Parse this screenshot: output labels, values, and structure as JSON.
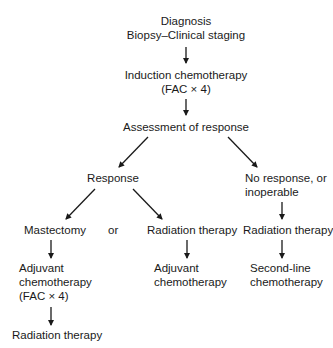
{
  "diagram": {
    "type": "flowchart",
    "nodes": {
      "diagnosis": {
        "line1": "Diagnosis",
        "line2": "Biopsy–Clinical staging"
      },
      "induction": {
        "line1": "Induction chemotherapy",
        "line2": "(FAC × 4)"
      },
      "assessment": {
        "label": "Assessment of response"
      },
      "response": {
        "label": "Response"
      },
      "no_response": {
        "line1": "No response, or",
        "line2": "inoperable"
      },
      "mastectomy": {
        "label": "Mastectomy"
      },
      "or_label": {
        "label": "or"
      },
      "radiation_mid": {
        "label": "Radiation therapy"
      },
      "radiation_right": {
        "label": "Radiation therapy"
      },
      "adjuvant_left": {
        "line1": "Adjuvant",
        "line2": "chemotherapy",
        "line3": "(FAC × 4)"
      },
      "adjuvant_mid": {
        "line1": "Adjuvant",
        "line2": "chemotherapy"
      },
      "second_line": {
        "line1": "Second-line",
        "line2": "chemotherapy"
      },
      "radiation_final": {
        "label": "Radiation therapy"
      }
    },
    "edges": [
      [
        "diagnosis",
        "induction"
      ],
      [
        "induction",
        "assessment"
      ],
      [
        "assessment",
        "response"
      ],
      [
        "assessment",
        "no_response"
      ],
      [
        "response",
        "mastectomy"
      ],
      [
        "response",
        "radiation_mid"
      ],
      [
        "no_response",
        "radiation_right"
      ],
      [
        "mastectomy",
        "adjuvant_left"
      ],
      [
        "radiation_mid",
        "adjuvant_mid"
      ],
      [
        "radiation_right",
        "second_line"
      ],
      [
        "adjuvant_left",
        "radiation_final"
      ]
    ],
    "colors": {
      "line": "#1a1a1a",
      "text": "#1a1a1a",
      "background": "#ffffff"
    }
  }
}
